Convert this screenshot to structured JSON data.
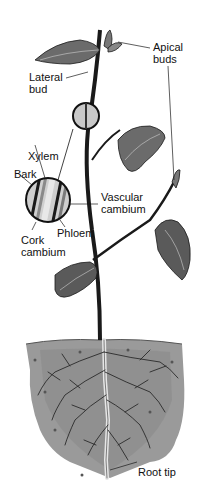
{
  "diagram": {
    "labels": {
      "apical_buds": [
        "Apical",
        "buds"
      ],
      "lateral_bud": [
        "Lateral",
        "bud"
      ],
      "xylem": "Xylem",
      "bark": "Bark",
      "vascular_cambium": [
        "Vascular",
        "cambium"
      ],
      "phloem": "Phloem",
      "cork_cambium": [
        "Cork",
        "cambium"
      ],
      "root_tip": "Root tip"
    },
    "colors": {
      "ink": "#1a1a1a",
      "leaf": "#6b6b6b",
      "leaf_dark": "#3a3a3a",
      "soil": "#9a9a9a",
      "soil_light": "#c4c4c4",
      "root": "#e6e6e6",
      "background": "#ffffff"
    }
  }
}
